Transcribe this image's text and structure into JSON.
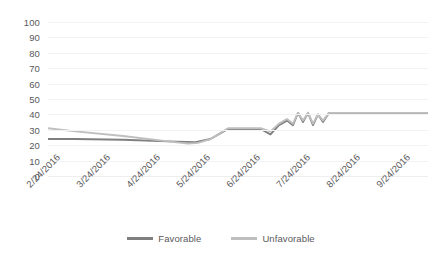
{
  "chart_data": {
    "type": "line",
    "title": "",
    "xlabel": "",
    "ylabel": "",
    "ylim": [
      0,
      100
    ],
    "ytick_values": [
      100,
      90,
      80,
      70,
      60,
      50,
      40,
      30,
      20,
      10,
      0
    ],
    "grid": true,
    "legend_position": "bottom",
    "categories": [
      "2/24/2016",
      "3/24/2016",
      "4/24/2016",
      "5/24/2016",
      "6/24/2016",
      "7/24/2016",
      "8/24/2016",
      "9/24/2016"
    ],
    "x": [
      0,
      1,
      2,
      3,
      4,
      5,
      6,
      7
    ],
    "series": [
      {
        "name": "Favorable",
        "color": "#7f7f7f",
        "x": [
          0,
          0.55,
          1.5,
          2.4,
          2.95,
          3.25,
          3.6,
          4.0,
          4.25,
          4.45,
          4.62,
          4.78,
          4.9,
          5.0,
          5.1,
          5.2,
          5.3,
          5.4,
          5.5,
          5.62,
          5.75,
          6.0,
          6.5,
          7.0,
          7.6
        ],
        "values": [
          24,
          24,
          23.5,
          22.5,
          22,
          24,
          30.5,
          30.5,
          30.5,
          27,
          33,
          36,
          33,
          41,
          35,
          41,
          33,
          40,
          35,
          41,
          41,
          41,
          41,
          41,
          41
        ]
      },
      {
        "name": "Unfavorable",
        "color": "#bfbfbf",
        "x": [
          0,
          0.55,
          1.5,
          2.4,
          2.8,
          3.0,
          3.25,
          3.6,
          4.0,
          4.25,
          4.45,
          4.62,
          4.78,
          4.9,
          5.0,
          5.1,
          5.2,
          5.3,
          5.4,
          5.5,
          5.62,
          5.75,
          6.0,
          6.5,
          7.0,
          7.6
        ],
        "values": [
          31,
          29,
          26,
          22.5,
          21,
          21.5,
          24,
          31,
          31,
          31,
          29,
          34,
          37,
          34,
          41,
          36,
          41,
          34,
          40,
          36,
          41,
          41,
          41,
          41,
          41,
          41
        ]
      }
    ]
  },
  "legend": {
    "items": [
      {
        "label": "Favorable",
        "color": "#7f7f7f"
      },
      {
        "label": "Unfavorable",
        "color": "#bfbfbf"
      }
    ]
  }
}
